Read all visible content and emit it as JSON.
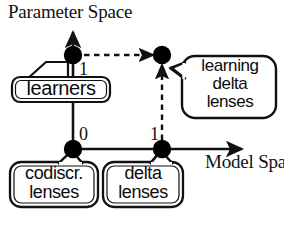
{
  "figure": {
    "kind": "diagram",
    "caption_axes": {
      "y_axis_title": "Parameter Space",
      "x_axis_title": "Model\nSpaces"
    },
    "stroke_color": "#111111",
    "node_fill_color": "#000000",
    "background_color": "#ffffff"
  },
  "axes": {
    "y": {
      "label": "Parameter Space",
      "direction": "up",
      "arrow": true,
      "origin_x": 73,
      "tip_y": 28
    },
    "x": {
      "label": "Model Spaces",
      "label_line1": "Model",
      "label_line2": "Spaces",
      "direction": "right",
      "arrow": true,
      "origin_y": 149,
      "tip_x": 246
    }
  },
  "ticks": [
    {
      "name": "y-one",
      "text": "1",
      "axis": "y",
      "value": 1
    },
    {
      "name": "origin-zero",
      "text": "0",
      "axis": "origin",
      "value": 0
    },
    {
      "name": "x-one",
      "text": "1",
      "axis": "x",
      "value": 1
    }
  ],
  "nodes": [
    {
      "name": "node-learners",
      "coord": "(0,1)",
      "x": 73,
      "y": 55,
      "filled": true
    },
    {
      "name": "node-learning-delta-lenses",
      "coord": "(1,1)",
      "x": 162,
      "y": 55,
      "filled": true
    },
    {
      "name": "node-codiscr-lenses",
      "coord": "(0,0)",
      "x": 73,
      "y": 149,
      "filled": true
    },
    {
      "name": "node-delta-lenses",
      "coord": "(1,0)",
      "x": 162,
      "y": 149,
      "filled": true
    }
  ],
  "edges": [
    {
      "name": "edge-learners-to-learning-delta-lenses",
      "from": "node-learners",
      "to": "node-learning-delta-lenses",
      "style": "dashed",
      "arrow": true,
      "orientation": "horizontal"
    },
    {
      "name": "edge-delta-lenses-to-learning-delta-lenses",
      "from": "node-delta-lenses",
      "to": "node-learning-delta-lenses",
      "style": "dashed",
      "arrow": true,
      "orientation": "vertical"
    }
  ],
  "callouts": [
    {
      "name": "learners",
      "label": "learners",
      "points_to": "node-learners",
      "tail_side": "top-right"
    },
    {
      "name": "learning-delta-lenses",
      "label": "learning\ndelta\nlenses",
      "points_to": "node-learning-delta-lenses",
      "tail_side": "left"
    },
    {
      "name": "codiscr-lenses",
      "label": "codiscr.\nlenses",
      "points_to": "node-codiscr-lenses",
      "tail_side": "top"
    },
    {
      "name": "delta-lenses",
      "label": "delta\nlenses",
      "points_to": "node-delta-lenses",
      "tail_side": "top"
    }
  ]
}
